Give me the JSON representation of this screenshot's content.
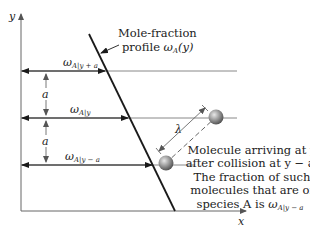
{
  "figure": {
    "axes": {
      "y_label": "y",
      "x_label": "x"
    },
    "profile": {
      "label_line1": "Mole-fraction",
      "label_line2_prefix": "profile ",
      "label_symbol": "ω",
      "label_symbol_sub": "A",
      "label_arg": "(y)"
    },
    "levels": [
      {
        "name": "y+a",
        "symbol": "ω",
        "sub": "A|y + a"
      },
      {
        "name": "y",
        "symbol": "ω",
        "sub": "A|y"
      },
      {
        "name": "y-a",
        "symbol": "ω",
        "sub": "A|y − a"
      }
    ],
    "spacing_labels": [
      "a",
      "a"
    ],
    "free_path_label": "λ",
    "caption": {
      "line1": "Molecule arriving at y",
      "line2": "after collision at y − a.",
      "line3": "The fraction of such",
      "line4": "molecules that are of",
      "line5_prefix": "species A is ",
      "line5_symbol": "ω",
      "line5_sub": "A|y − a"
    },
    "colors": {
      "axis": "#666666",
      "line": "#1a1a1a",
      "guide": "#888888",
      "ball": "#8a8a8a"
    }
  }
}
